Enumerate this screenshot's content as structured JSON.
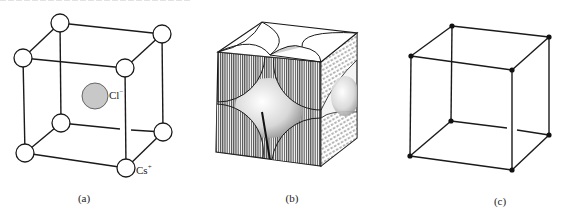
{
  "figure": {
    "panels": [
      {
        "id": "a",
        "caption": "(a)",
        "ions": {
          "center": {
            "symbol": "Cl",
            "charge": "−",
            "fill": "#c8c8c8"
          },
          "corner": {
            "symbol": "Cs",
            "charge": "+",
            "fill": "#ffffff"
          }
        }
      },
      {
        "id": "b",
        "caption": "(b)"
      },
      {
        "id": "c",
        "caption": "(c)"
      }
    ]
  },
  "colors": {
    "line": "#1a1a1a",
    "background": "#ffffff",
    "chloride": "#c8c8c8",
    "hatch_dark": "#555555",
    "shade_light": "#e6e6e6"
  }
}
